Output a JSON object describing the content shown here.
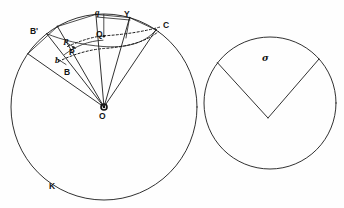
{
  "figure": {
    "background_color": "#fefefe",
    "ink_color": "#1a1a1a",
    "width": 344,
    "height": 208
  },
  "left_circle": {
    "name": "circle-K",
    "center": {
      "x": 104,
      "y": 107,
      "label": "O"
    },
    "radius": 93,
    "boundary_label": "K",
    "boundary_label_pos": {
      "x": 52,
      "y": 186
    },
    "center_label_pos": {
      "x": 100,
      "y": 113
    },
    "radii_endpoints": [
      {
        "label": "B'",
        "angle_deg": 145,
        "label_pos": {
          "x": 32,
          "y": 31
        }
      },
      {
        "label": "B",
        "angle_deg": 128,
        "label_pos": {
          "x": 64,
          "y": 73
        }
      },
      {
        "label": "P",
        "angle_deg": 120,
        "label_pos": {
          "x": 72,
          "y": 52
        }
      },
      {
        "label": "Q",
        "angle_deg": 95,
        "label_pos": {
          "x": 94,
          "y": 35
        }
      },
      {
        "label": "Y",
        "angle_deg": 74,
        "label_pos": {
          "x": 126,
          "y": 14
        }
      },
      {
        "label": "C",
        "angle_deg": 56,
        "label_pos": {
          "x": 166,
          "y": 24
        }
      }
    ],
    "lowercase_labels": [
      {
        "label": "q",
        "pos": {
          "x": 94,
          "y": 12
        }
      },
      {
        "label": "p",
        "pos": {
          "x": 68,
          "y": 40
        }
      },
      {
        "label": "b",
        "pos": {
          "x": 58,
          "y": 60
        }
      }
    ]
  },
  "right_circle": {
    "name": "circle-sigma",
    "center": {
      "x": 270,
      "y": 103
    },
    "radius": 66,
    "sector_label": "σ",
    "sector_label_pos": {
      "x": 264,
      "y": 58
    },
    "apex": {
      "x": 268,
      "y": 118
    },
    "sector_start_angle_deg": 143,
    "sector_end_angle_deg": 42
  },
  "labels": {
    "B_prime": "B'",
    "B": "B",
    "P": "P",
    "Q": "Q",
    "Y": "Y",
    "C": "C",
    "O": "O",
    "K": "K",
    "q": "q",
    "p": "p",
    "b": "b",
    "sigma": "σ"
  }
}
